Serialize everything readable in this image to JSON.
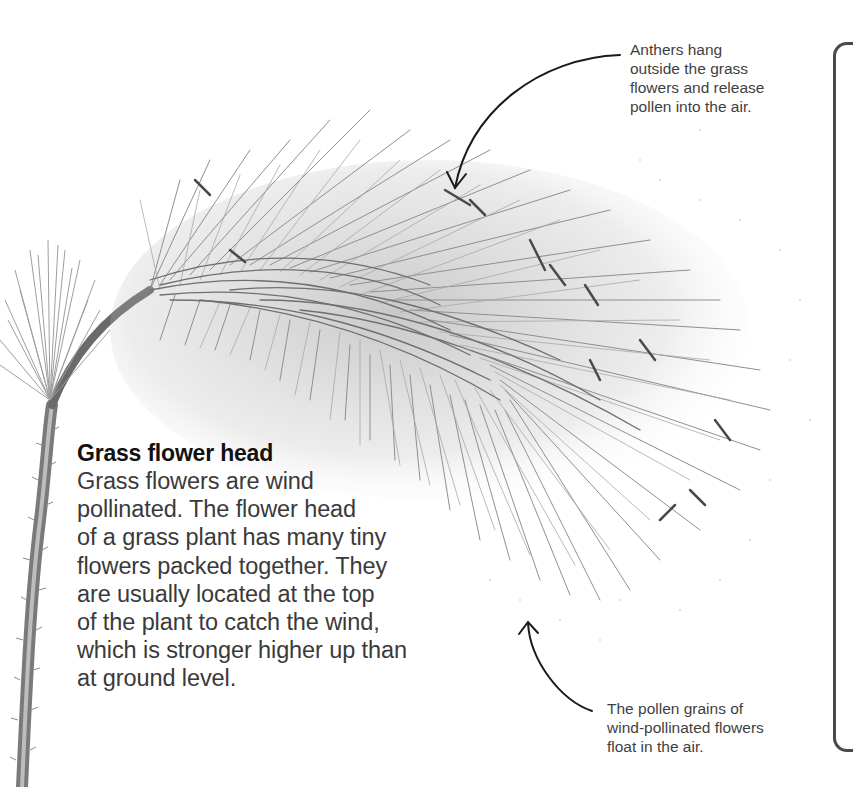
{
  "page": {
    "cutoff_title": "Grass flower head"
  },
  "main_caption": {
    "heading": "Grass flower head",
    "body_lines": [
      "Grass flowers are wind",
      "pollinated. The flower head",
      "of a grass plant has many tiny",
      "flowers packed together. They",
      "are usually located at the top",
      "of the plant to catch the wind,",
      "which is stronger higher up than",
      "at ground level."
    ]
  },
  "annotations": {
    "anthers": {
      "lines": [
        "Anthers hang",
        "outside the grass",
        "flowers and release",
        "pollen into the air."
      ]
    },
    "pollen": {
      "lines": [
        "The pollen grains of",
        "wind-pollinated flowers",
        "float in the air."
      ]
    }
  },
  "illustration": {
    "subject": "grass-flower-head-photo",
    "colors": {
      "stem": "#6e6e6e",
      "bristles": "#8a8a8a",
      "dark_bristles": "#555555",
      "arrow": "#1a1a1a",
      "bracket": "#4a4a4a"
    }
  }
}
